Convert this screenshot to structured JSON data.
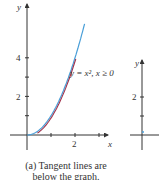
{
  "figure": {
    "panel_a": {
      "y_axis_label": "y",
      "x_axis_label": "x",
      "y_ticks": [
        "2",
        "4"
      ],
      "x_ticks": [
        "2"
      ],
      "curve_label": "y = x², x ≥ 0",
      "caption_line1": "(a) Tangent lines are",
      "caption_line2": "below the graph."
    },
    "panel_b": {
      "y_axis_label": "y",
      "y_ticks": [
        "2"
      ]
    },
    "colors": {
      "curve": "#4a9fd8",
      "tangent": "#a0304a",
      "axis": "#333333"
    }
  },
  "chart_data": {
    "type": "line",
    "title": "",
    "xlabel": "x",
    "ylabel": "y",
    "xlim": [
      -0.7,
      3.4
    ],
    "ylim": [
      -0.8,
      5.8
    ],
    "series": [
      {
        "name": "y = x^2, x >= 0",
        "function": "x^2",
        "domain": [
          0,
          2.4
        ]
      },
      {
        "name": "tangent segments",
        "note": "short tangent lines drawn below the curve"
      }
    ],
    "x_ticks": [
      1,
      2,
      3
    ],
    "y_ticks": [
      1,
      2,
      3,
      4
    ]
  }
}
